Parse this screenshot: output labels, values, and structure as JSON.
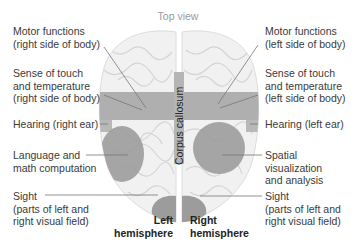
{
  "title": "Top view",
  "center_label": "Corpus callosum",
  "left_labels": [
    {
      "lines": [
        "Motor functions",
        "(right side of body)"
      ]
    },
    {
      "lines": [
        "Sense of touch",
        "and temperature",
        "(right side of body)"
      ]
    },
    {
      "lines": [
        "Hearing (right ear)"
      ]
    },
    {
      "lines": [
        "Language and",
        "math computation"
      ]
    },
    {
      "lines": [
        "Sight",
        "(parts of left and",
        "right visual field)"
      ]
    }
  ],
  "right_labels": [
    {
      "lines": [
        "Motor functions",
        "(left side of body)"
      ]
    },
    {
      "lines": [
        "Sense of touch",
        "and temperature",
        "(left side of body)"
      ]
    },
    {
      "lines": [
        "Hearing (left ear)"
      ]
    },
    {
      "lines": [
        "Spatial",
        "visualization",
        "and analysis"
      ]
    },
    {
      "lines": [
        "Sight",
        "(parts of left and",
        "right visual field)"
      ]
    }
  ],
  "hemispheres": {
    "left": [
      "Left",
      "hemisphere"
    ],
    "right": [
      "Right",
      "hemisphere"
    ]
  },
  "colors": {
    "brain_fill": "#f1f1f1",
    "brain_folds": "#d6d6d6",
    "region_shade": "#9a9a9a",
    "leader_line": "#777777",
    "title": "#9a9a9a"
  }
}
